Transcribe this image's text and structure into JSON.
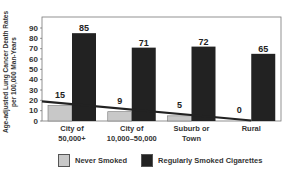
{
  "chart_data": {
    "type": "bar",
    "title": "",
    "xlabel": "",
    "ylabel": "Age-adjusted Lung Cancer Death Rates per 100,000 Man-Years",
    "ylabel_lines": [
      "Age-adjusted Lung Cancer Death Rates",
      "per 100,000 Man-Years"
    ],
    "ylim": [
      0,
      90
    ],
    "yticks": [
      0,
      10,
      20,
      30,
      40,
      50,
      60,
      70,
      80,
      90
    ],
    "grid": false,
    "legend_position": "bottom",
    "categories": [
      "City of 50,000+",
      "City of 10,000–50,000",
      "Suburb or Town",
      "Rural"
    ],
    "category_lines": [
      [
        "City of",
        "50,000+"
      ],
      [
        "City of",
        "10,000–50,000"
      ],
      [
        "Suburb or",
        "Town"
      ],
      [
        "Rural"
      ]
    ],
    "series": [
      {
        "name": "Never Smoked",
        "values": [
          15,
          9,
          5,
          0
        ],
        "color": "#c8c8c8"
      },
      {
        "name": "Regularly Smoked Cigarettes",
        "values": [
          85,
          71,
          72,
          65
        ],
        "color": "#222222"
      }
    ],
    "annotations": [
      "Trend line across Never Smoked values descending from ~19 to ~0"
    ]
  },
  "legend": {
    "items": [
      {
        "label": "Never Smoked",
        "color": "#c8c8c8"
      },
      {
        "label": "Regularly Smoked Cigarettes",
        "color": "#222222"
      }
    ]
  }
}
